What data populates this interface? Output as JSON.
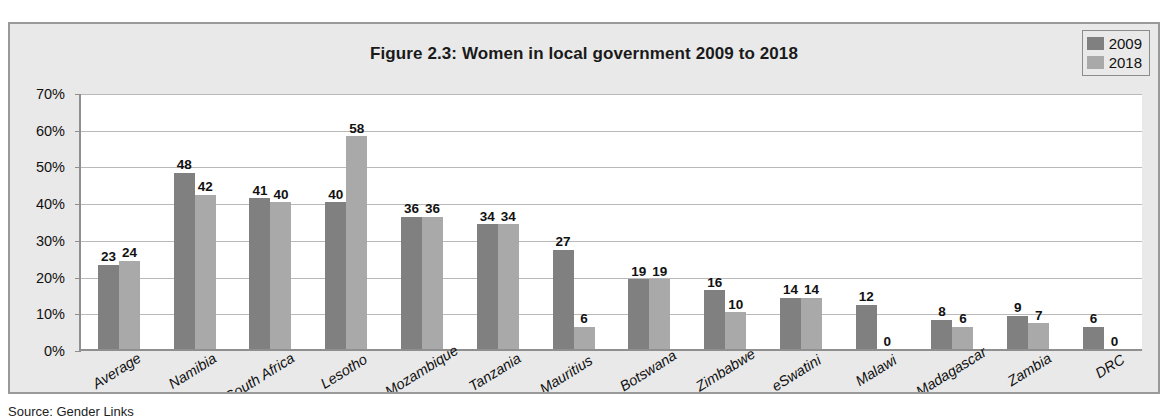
{
  "chart_data": {
    "type": "bar",
    "title": "Figure 2.3: Women in local government 2009 to 2018",
    "xlabel": "",
    "ylabel": "",
    "ylim": [
      0,
      70
    ],
    "ytick_labels": [
      "0%",
      "10%",
      "20%",
      "30%",
      "40%",
      "50%",
      "60%",
      "70%"
    ],
    "ytick_values": [
      0,
      10,
      20,
      30,
      40,
      50,
      60,
      70
    ],
    "grid": true,
    "legend_position": "top-right",
    "categories": [
      "Average",
      "Namibia",
      "South Africa",
      "Lesotho",
      "Mozambique",
      "Tanzania",
      "Mauritius",
      "Botswana",
      "Zimbabwe",
      "eSwatini",
      "Malawi",
      "Madagascar",
      "Zambia",
      "DRC"
    ],
    "series": [
      {
        "name": "2009",
        "color": "#808080",
        "values": [
          23,
          48,
          41,
          40,
          36,
          34,
          27,
          19,
          16,
          14,
          12,
          8,
          9,
          6
        ]
      },
      {
        "name": "2018",
        "color": "#a9a9a9",
        "values": [
          24,
          42,
          40,
          58,
          36,
          34,
          6,
          19,
          10,
          14,
          0,
          6,
          7,
          0
        ]
      }
    ]
  },
  "legend": {
    "items": [
      {
        "label": "2009",
        "color": "#808080"
      },
      {
        "label": "2018",
        "color": "#a9a9a9"
      }
    ]
  },
  "colors": {
    "series_2009": "#808080",
    "series_2018": "#a9a9a9",
    "chart_background": "#e9e9e9",
    "plot_background": "#ffffff",
    "gridline": "#b9b9b9",
    "axis": "#8f8f8f",
    "frame_border": "#9a9a9a"
  },
  "source_note": "Source: Gender Links"
}
